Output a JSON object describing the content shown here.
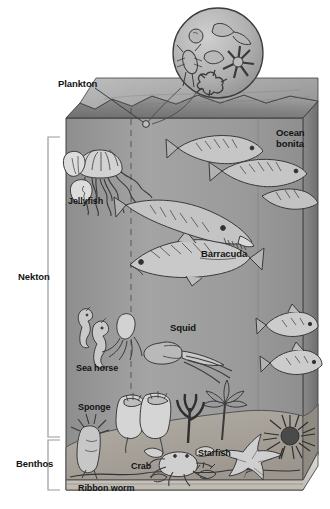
{
  "figure": {
    "zone_labels": [
      {
        "id": "nekton",
        "label": "Nekton"
      },
      {
        "id": "benthos",
        "label": "Benthos"
      }
    ],
    "organism_labels": [
      {
        "id": "plankton",
        "label": "Plankton"
      },
      {
        "id": "ocean_bonita",
        "label": "Ocean\nbonita"
      },
      {
        "id": "jellyfish",
        "label": "Jellyfish"
      },
      {
        "id": "barracuda",
        "label": "Barracuda"
      },
      {
        "id": "squid",
        "label": "Squid"
      },
      {
        "id": "sea_horse",
        "label": "Sea horse"
      },
      {
        "id": "sponge",
        "label": "Sponge"
      },
      {
        "id": "crab",
        "label": "Crab"
      },
      {
        "id": "starfish",
        "label": "Starfish"
      },
      {
        "id": "ribbon_worm",
        "label": "Ribbon worm"
      }
    ],
    "callout": {
      "name": "plankton-magnifier",
      "description": "Magnified circular inset showing plankton organisms"
    },
    "colors": {
      "water_front": "#9d9d9d",
      "water_left": "#8c8c8c",
      "surface_top": "#7c7c7c",
      "surface_top_light": "#b4b4b4",
      "sea_floor": "#a8a39c",
      "floor_edge": "#d8d5d0",
      "inset_fill": "#b0b0b0",
      "outline": "#3b3b3b",
      "label_text": "#141414",
      "background": "#ffffff"
    }
  }
}
